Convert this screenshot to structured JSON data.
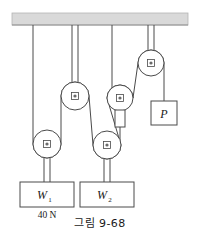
{
  "figure": {
    "caption": "그림 9-68",
    "ceiling_label": "ceiling-support",
    "colors": {
      "ceiling_fill": "#d9d9d9",
      "ceiling_stroke": "#b0b0b0",
      "line": "#3a3a3a",
      "rope": "#555555",
      "block_fill": "#ffffff",
      "block_stroke": "#4a4a4a",
      "pulley_fill": "#ffffff",
      "pulley_stroke": "#4a4a4a",
      "text": "#1a1a1a"
    }
  },
  "blocks": [
    {
      "id": "w1",
      "label": "W",
      "subscript": "1",
      "note": "40 N"
    },
    {
      "id": "w2",
      "label": "W",
      "subscript": "2",
      "note": ""
    },
    {
      "id": "p",
      "label": "P",
      "subscript": "",
      "note": ""
    }
  ],
  "annotations": {
    "w1_force": "40 N"
  },
  "pulleys": [
    {
      "id": "pulley-a",
      "role": "fixed-upper-left",
      "cx": 75,
      "cy": 96,
      "r": 14
    },
    {
      "id": "pulley-b",
      "role": "movable-left",
      "cx": 47,
      "cy": 144,
      "r": 14
    },
    {
      "id": "pulley-c",
      "role": "fixed-middle-right",
      "cx": 120,
      "cy": 98,
      "r": 13
    },
    {
      "id": "pulley-d",
      "role": "movable-right",
      "cx": 107,
      "cy": 145,
      "r": 14
    },
    {
      "id": "pulley-e",
      "role": "fixed-upper-right",
      "cx": 151,
      "cy": 63,
      "r": 13
    }
  ]
}
